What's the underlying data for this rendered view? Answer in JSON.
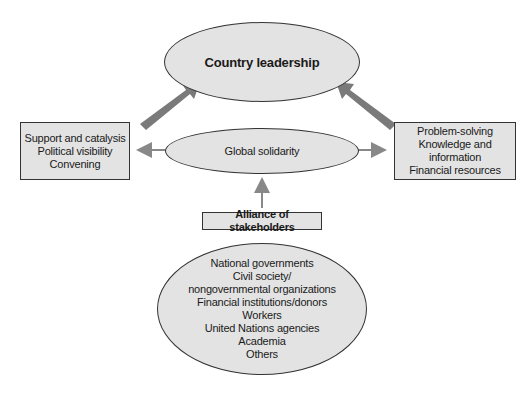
{
  "country_leadership": {
    "label": "Country leadership"
  },
  "global_solidarity": {
    "label": "Global solidarity"
  },
  "left_box": {
    "lines": [
      "Support and catalysis",
      "Political visibility",
      "Convening"
    ]
  },
  "right_box": {
    "lines": [
      "Problem-solving",
      "Knowledge and information",
      "Financial resources"
    ]
  },
  "alliance": {
    "label": "Alliance of stakeholders"
  },
  "stakeholders": {
    "lines": [
      "National governments",
      "Civil society/",
      "nongovernmental organizations",
      "Financial institutions/donors",
      "Workers",
      "United Nations agencies",
      "Academia",
      "Others"
    ]
  },
  "colors": {
    "fill": "#e3e3e3",
    "stroke": "#333333",
    "arrow": "#888888",
    "big_arrow": "#7a7a7a"
  }
}
